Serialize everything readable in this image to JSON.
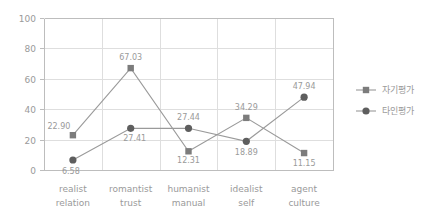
{
  "chart_data": {
    "type": "line",
    "title": "",
    "xlabel": "",
    "ylabel": "",
    "ylim": [
      0,
      100
    ],
    "yticks": [
      0,
      20,
      40,
      60,
      80,
      100
    ],
    "grid": true,
    "legend_position": "right",
    "categories": [
      "realist relation",
      "romantist trust",
      "humanist manual",
      "idealist self",
      "agent culture"
    ],
    "category_lines": [
      [
        "realist",
        "relation"
      ],
      [
        "romantist",
        "trust"
      ],
      [
        "humanist",
        "manual"
      ],
      [
        "idealist",
        "self"
      ],
      [
        "agent",
        "culture"
      ]
    ],
    "series": [
      {
        "name": "자기평가",
        "marker": "square",
        "color": "#7c7c7c",
        "values": [
          22.9,
          67.03,
          12.31,
          34.29,
          11.15
        ],
        "labels": [
          "22.90",
          "67.03",
          "12.31",
          "34.29",
          "11.15"
        ]
      },
      {
        "name": "타인평가",
        "marker": "circle",
        "color": "#5e5e5e",
        "values": [
          6.58,
          27.41,
          27.44,
          18.89,
          47.94
        ],
        "labels": [
          "6.58",
          "27.41",
          "27.44",
          "18.89",
          "47.94"
        ]
      }
    ]
  },
  "axis": {
    "ytick_labels": [
      "0",
      "20",
      "40",
      "60",
      "80",
      "100"
    ]
  },
  "legend": {
    "items": [
      {
        "label": "자기평가",
        "marker": "square"
      },
      {
        "label": "타인평가",
        "marker": "circle"
      }
    ]
  },
  "colors": {
    "self_series": "#7c7c7c",
    "other_series": "#5e5e5e",
    "grid": "#dedede",
    "axis": "#bdbdbd",
    "text": "#9a9a9a",
    "background": "#ffffff"
  }
}
